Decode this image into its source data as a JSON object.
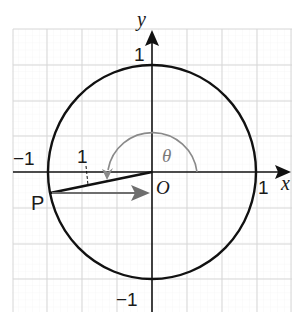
{
  "diagram": {
    "type": "unit-circle",
    "axes": {
      "x_label": "x",
      "y_label": "y",
      "origin_label": "O",
      "tick_labels": {
        "x_pos": "1",
        "x_neg": "−1",
        "y_pos": "1",
        "y_neg": "−1"
      }
    },
    "point": {
      "label": "P"
    },
    "radius_label": "1",
    "angle_label": "θ",
    "colors": {
      "axis": "#111111",
      "circle": "#111111",
      "grid_major": "#d9d9d9",
      "grid_minor": "#efefef",
      "angle_arc": "#808080",
      "vector_arrow": "#6e6e6e"
    }
  }
}
